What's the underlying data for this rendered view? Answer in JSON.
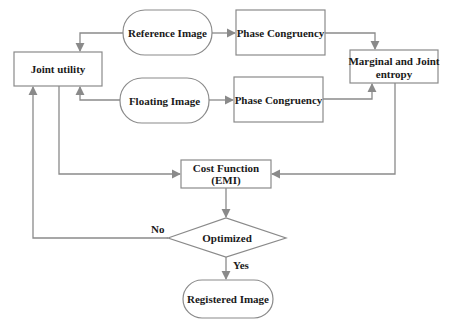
{
  "diagram": {
    "type": "flowchart",
    "colors": {
      "stroke": "#8a8a8a",
      "text": "#1a1a1a",
      "background": "#ffffff"
    },
    "nodes": {
      "reference_image": {
        "label": "Reference Image",
        "shape": "rounded"
      },
      "phase_congruency_1": {
        "label": "Phase Congruency",
        "shape": "rect"
      },
      "floating_image": {
        "label": "Floating Image",
        "shape": "rounded"
      },
      "phase_congruency_2": {
        "label": "Phase Congruency",
        "shape": "rect"
      },
      "joint_utility": {
        "label": "Joint utility",
        "shape": "rect"
      },
      "marginal_joint_entropy": {
        "label_line1": "Marginal and Joint",
        "label_line2": "entropy",
        "shape": "rect"
      },
      "cost_function": {
        "label_line1": "Cost Function",
        "label_line2": "(EMI)",
        "shape": "rect"
      },
      "optimized": {
        "label": "Optimized",
        "shape": "diamond"
      },
      "registered_image": {
        "label": "Registered Image",
        "shape": "rounded"
      }
    },
    "edge_labels": {
      "no": "No",
      "yes": "Yes"
    },
    "edges": [
      {
        "from": "reference_image",
        "to": "phase_congruency_1"
      },
      {
        "from": "reference_image",
        "to": "joint_utility"
      },
      {
        "from": "floating_image",
        "to": "phase_congruency_2"
      },
      {
        "from": "floating_image",
        "to": "joint_utility"
      },
      {
        "from": "phase_congruency_1",
        "to": "marginal_joint_entropy"
      },
      {
        "from": "phase_congruency_2",
        "to": "marginal_joint_entropy"
      },
      {
        "from": "joint_utility",
        "to": "cost_function"
      },
      {
        "from": "marginal_joint_entropy",
        "to": "cost_function"
      },
      {
        "from": "cost_function",
        "to": "optimized"
      },
      {
        "from": "optimized",
        "to": "joint_utility",
        "label": "No"
      },
      {
        "from": "optimized",
        "to": "registered_image",
        "label": "Yes"
      }
    ]
  }
}
